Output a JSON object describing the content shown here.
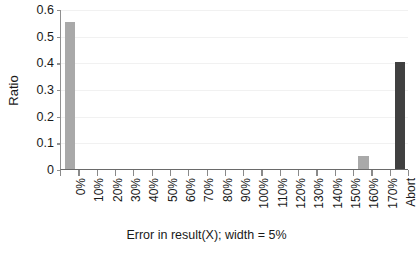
{
  "chart_data": {
    "type": "bar",
    "title": "",
    "xlabel": "Error in result(X); width = 5%",
    "ylabel": "Ratio",
    "categories": [
      "0%",
      "10%",
      "20%",
      "30%",
      "40%",
      "50%",
      "60%",
      "70%",
      "80%",
      "90%",
      "100%",
      "110%",
      "120%",
      "130%",
      "140%",
      "150%",
      "160%",
      "170%",
      "Abort"
    ],
    "values": [
      0.55,
      0,
      0,
      0,
      0,
      0,
      0,
      0,
      0,
      0,
      0,
      0,
      0,
      0,
      0,
      0,
      0.05,
      0,
      0.4
    ],
    "ylim": [
      0,
      0.6
    ],
    "ytick_labels": [
      "0",
      "0.1",
      "0.2",
      "0.3",
      "0.4",
      "0.5",
      "0.6"
    ],
    "ytick_values": [
      0,
      0.1,
      0.2,
      0.3,
      0.4,
      0.5,
      0.6
    ],
    "grid": true,
    "legend": "none",
    "bar_colors": [
      "#a9a9a9",
      "#a9a9a9",
      "#a9a9a9",
      "#a9a9a9",
      "#a9a9a9",
      "#a9a9a9",
      "#a9a9a9",
      "#a9a9a9",
      "#a9a9a9",
      "#a9a9a9",
      "#a9a9a9",
      "#a9a9a9",
      "#a9a9a9",
      "#a9a9a9",
      "#a9a9a9",
      "#a9a9a9",
      "#a9a9a9",
      "#a9a9a9",
      "#404040"
    ],
    "colors": {
      "bar_light": "#a9a9a9",
      "bar_dark": "#404040",
      "axis": "#6a6a6a",
      "grid": "#f1f1f1",
      "text": "#1a1a1a",
      "background": "#ffffff"
    }
  }
}
